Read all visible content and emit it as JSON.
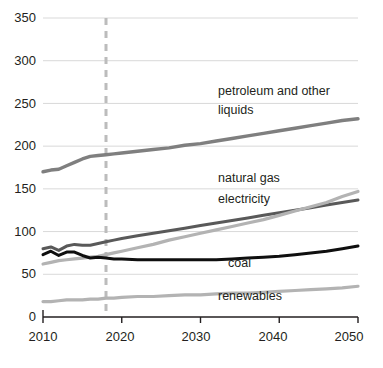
{
  "chart_data": {
    "type": "line",
    "title": "",
    "xlabel": "",
    "ylabel": "",
    "xlim": [
      2010,
      2050
    ],
    "ylim": [
      0,
      350
    ],
    "grid": true,
    "legend_position": "inline-labels",
    "x_ticks": [
      "2010",
      "2020",
      "2030",
      "2040",
      "2050"
    ],
    "y_ticks": [
      "0",
      "50",
      "100",
      "150",
      "200",
      "250",
      "300",
      "350"
    ],
    "annotations": [
      {
        "name": "projection-divider",
        "type": "vertical-dashed-line",
        "x": 2018,
        "color": "#bcbcbc"
      }
    ],
    "x": [
      2010,
      2011,
      2012,
      2013,
      2014,
      2015,
      2016,
      2017,
      2018,
      2019,
      2020,
      2022,
      2024,
      2026,
      2028,
      2030,
      2032,
      2034,
      2036,
      2038,
      2040,
      2042,
      2044,
      2046,
      2048,
      2050
    ],
    "series": [
      {
        "name": "petroleum and other liquids",
        "label": "petroleum and other liquids",
        "color": "#7f7f7f",
        "width": 3.4,
        "values": [
          170,
          172,
          173,
          177,
          181,
          185,
          188,
          189,
          190,
          191,
          192,
          194,
          196,
          198,
          201,
          203,
          206,
          209,
          212,
          215,
          218,
          221,
          224,
          227,
          230,
          232
        ]
      },
      {
        "name": "natural gas",
        "label": "natural gas",
        "color": "#595959",
        "width": 3.0,
        "values": [
          80,
          82,
          78,
          83,
          85,
          84,
          84,
          86,
          88,
          90,
          92,
          95,
          98,
          101,
          104,
          107,
          110,
          113,
          116,
          119,
          122,
          125,
          128,
          131,
          134,
          137
        ]
      },
      {
        "name": "electricity",
        "label": "electricity",
        "color": "#b3b3b3",
        "width": 3.2,
        "values": [
          62,
          64,
          66,
          67,
          68,
          69,
          70,
          71,
          73,
          75,
          77,
          81,
          85,
          90,
          94,
          98,
          102,
          106,
          110,
          114,
          119,
          124,
          129,
          134,
          141,
          147
        ]
      },
      {
        "name": "coal",
        "label": "coal",
        "color": "#0f0f0f",
        "width": 3.0,
        "values": [
          73,
          77,
          72,
          76,
          76,
          72,
          69,
          70,
          69,
          68,
          68,
          67,
          67,
          67,
          67,
          67,
          67,
          68,
          69,
          70,
          71,
          73,
          75,
          77,
          80,
          83
        ]
      },
      {
        "name": "renewables",
        "label": "renewables",
        "color": "#b3b3b3",
        "width": 3.2,
        "values": [
          18,
          18,
          19,
          20,
          20,
          20,
          21,
          21,
          22,
          22,
          23,
          24,
          24,
          25,
          26,
          26,
          27,
          28,
          28,
          29,
          30,
          31,
          32,
          33,
          34,
          36
        ]
      }
    ],
    "inline_labels": [
      {
        "name": "label-petroleum-line1",
        "text": "petroleum and other",
        "x": 218,
        "y": 84
      },
      {
        "name": "label-petroleum-line2",
        "text": "liquids",
        "x": 218,
        "y": 103
      },
      {
        "name": "label-natural-gas",
        "text": "natural gas",
        "x": 218,
        "y": 171
      },
      {
        "name": "label-electricity",
        "text": "electricity",
        "x": 218,
        "y": 192
      },
      {
        "name": "label-coal",
        "text": "coal",
        "x": 228,
        "y": 256
      },
      {
        "name": "label-renewables",
        "text": "renewables",
        "x": 218,
        "y": 289
      }
    ]
  },
  "axis": {
    "y_labels": [
      {
        "text": "350",
        "y": 11
      },
      {
        "text": "300",
        "y": 54
      },
      {
        "text": "250",
        "y": 97
      },
      {
        "text": "200",
        "y": 139
      },
      {
        "text": "150",
        "y": 182
      },
      {
        "text": "100",
        "y": 225
      },
      {
        "text": "50",
        "y": 267
      },
      {
        "text": "0",
        "y": 310
      }
    ],
    "x_labels": [
      {
        "text": "2010",
        "x": 19
      },
      {
        "text": "2020",
        "x": 96
      },
      {
        "text": "2030",
        "x": 172
      },
      {
        "text": "2040",
        "x": 249
      },
      {
        "text": "2050",
        "x": 325
      }
    ],
    "axis_color": "#231f20",
    "grid_color": "#d9d9d9"
  }
}
